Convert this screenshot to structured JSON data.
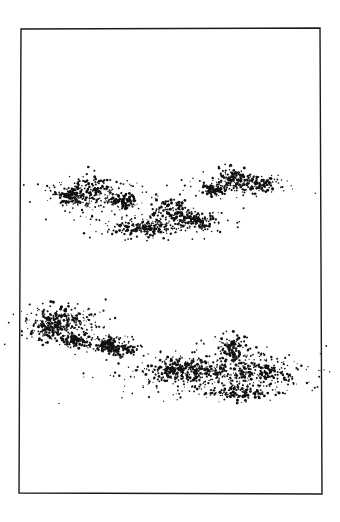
{
  "artwork": {
    "subject": "stippled ink clouds",
    "background": "#ffffff",
    "ink": "#111111",
    "frame": {
      "points": [
        [
          21,
          29
        ],
        [
          320,
          28
        ],
        [
          322,
          494
        ],
        [
          19,
          493
        ]
      ],
      "stroke_width": 1.4,
      "color": "#1a1a1a"
    },
    "clouds": [
      {
        "name": "cloud-upper-left",
        "cx": 95,
        "cy": 197,
        "rx": 48,
        "ry": 14,
        "count": 420,
        "peaks": [
          [
            95,
            185,
            20,
            12
          ],
          [
            72,
            196,
            16,
            9
          ],
          [
            124,
            202,
            14,
            6
          ]
        ],
        "seed": 11
      },
      {
        "name": "cloud-upper-center",
        "cx": 162,
        "cy": 223,
        "rx": 58,
        "ry": 14,
        "count": 480,
        "peaks": [
          [
            172,
            210,
            20,
            14
          ],
          [
            140,
            228,
            28,
            9
          ],
          [
            195,
            220,
            18,
            8
          ]
        ],
        "seed": 23
      },
      {
        "name": "cloud-upper-right",
        "cx": 242,
        "cy": 183,
        "rx": 44,
        "ry": 12,
        "count": 380,
        "peaks": [
          [
            232,
            178,
            16,
            12
          ],
          [
            258,
            184,
            18,
            7
          ],
          [
            215,
            190,
            12,
            6
          ]
        ],
        "seed": 37
      },
      {
        "name": "cloud-lower-left",
        "cx": 60,
        "cy": 325,
        "rx": 40,
        "ry": 18,
        "count": 430,
        "peaks": [
          [
            62,
            318,
            24,
            14
          ],
          [
            50,
            330,
            18,
            10
          ],
          [
            75,
            340,
            14,
            7
          ]
        ],
        "seed": 41
      },
      {
        "name": "cloud-lower-middle",
        "cx": 110,
        "cy": 346,
        "rx": 30,
        "ry": 9,
        "count": 220,
        "peaks": [
          [
            108,
            344,
            10,
            7
          ],
          [
            120,
            350,
            16,
            6
          ]
        ],
        "seed": 53
      },
      {
        "name": "cloud-lower-right",
        "cx": 215,
        "cy": 372,
        "rx": 82,
        "ry": 22,
        "count": 950,
        "peaks": [
          [
            232,
            350,
            18,
            14
          ],
          [
            205,
            372,
            34,
            14
          ],
          [
            175,
            370,
            26,
            10
          ],
          [
            262,
            372,
            30,
            10
          ],
          [
            240,
            392,
            34,
            8
          ]
        ],
        "seed": 67
      }
    ]
  }
}
